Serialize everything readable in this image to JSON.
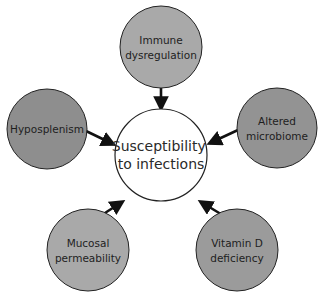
{
  "diagram": {
    "type": "hub-and-spoke",
    "center": {
      "lines": [
        "Susceptibility",
        "to infections"
      ],
      "fill": "#ffffff",
      "cx": 161,
      "cy": 155,
      "r": 46
    },
    "nodes": [
      {
        "id": "immune",
        "lines": [
          "Immune",
          "dysregulation"
        ],
        "fill": "#a9a9a9",
        "cx": 161,
        "cy": 47,
        "r": 41
      },
      {
        "id": "hyposplenism",
        "lines": [
          "Hyposplenism"
        ],
        "fill": "#8e8e8e",
        "cx": 47,
        "cy": 129,
        "r": 40
      },
      {
        "id": "microbiome",
        "lines": [
          "Altered",
          "microbiome"
        ],
        "fill": "#939393",
        "cx": 277,
        "cy": 128,
        "r": 40
      },
      {
        "id": "mucosal",
        "lines": [
          "Mucosal",
          "permeability"
        ],
        "fill": "#a9a9a9",
        "cx": 88,
        "cy": 250,
        "r": 41
      },
      {
        "id": "vitamin-d",
        "lines": [
          "Vitamin D",
          "deficiency"
        ],
        "fill": "#9b9b9b",
        "cx": 237,
        "cy": 250,
        "r": 41
      }
    ],
    "arrows": [
      {
        "from": "immune",
        "x1": 161,
        "y1": 88,
        "x2": 161,
        "y2": 108
      },
      {
        "from": "hyposplenism",
        "x1": 86,
        "y1": 131,
        "x2": 113,
        "y2": 144
      },
      {
        "from": "microbiome",
        "x1": 238,
        "y1": 130,
        "x2": 210,
        "y2": 143
      },
      {
        "from": "mucosal",
        "x1": 91,
        "y1": 222,
        "x2": 122,
        "y2": 202
      },
      {
        "from": "vitamin-d",
        "x1": 234,
        "y1": 222,
        "x2": 201,
        "y2": 202
      }
    ],
    "stroke": "#111111"
  }
}
